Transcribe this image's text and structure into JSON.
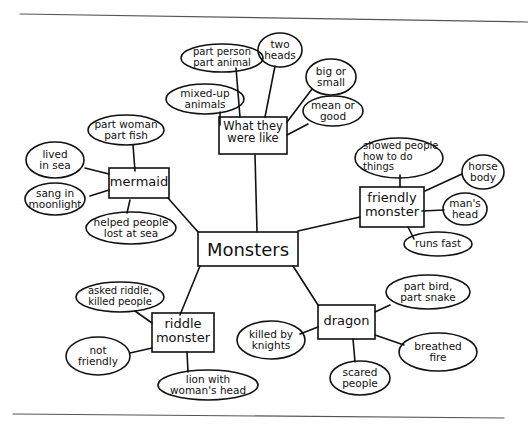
{
  "diagram": {
    "type": "mind-map",
    "center": {
      "label": "Monsters"
    },
    "branches": [
      {
        "label": "What they were like",
        "details": [
          "part person part animal",
          "two heads",
          "mixed-up animals",
          "big or small",
          "mean or good"
        ]
      },
      {
        "label": "mermaid",
        "details": [
          "part woman part fish",
          "lived in sea",
          "sang in moonlight",
          "helped people lost at sea"
        ]
      },
      {
        "label": "friendly monster",
        "details": [
          "showed people how to do things",
          "horse body",
          "man's head",
          "runs fast"
        ]
      },
      {
        "label": "riddle monster",
        "details": [
          "asked riddle, killed people",
          "not friendly",
          "lion with woman's head"
        ]
      },
      {
        "label": "dragon",
        "details": [
          "part bird, part snake",
          "killed by knights",
          "breathed fire",
          "scared people"
        ]
      }
    ]
  },
  "labels": {
    "center": "Monsters",
    "what": "What they\nwere like",
    "what_1": "part person\npart animal",
    "what_2": "two\nheads",
    "what_3": "mixed-up\nanimals",
    "what_4": "big or\nsmall",
    "what_5": "mean or\ngood",
    "mermaid": "mermaid",
    "mermaid_1": "part woman\npart fish",
    "mermaid_2": "lived\nin sea",
    "mermaid_3": "sang in\nmoonlight",
    "mermaid_4": "helped people\nlost at sea",
    "friendly": "friendly\nmonster",
    "friendly_1": "showed people\nhow to do\nthings",
    "friendly_2": "horse\nbody",
    "friendly_3": "man's\nhead",
    "friendly_4": "runs fast",
    "riddle": "riddle\nmonster",
    "riddle_1": "asked riddle,\nkilled people",
    "riddle_2": "not\nfriendly",
    "riddle_3": "lion with\nwoman's head",
    "dragon": "dragon",
    "dragon_1": "part bird,\npart snake",
    "dragon_2": "killed by\nknights",
    "dragon_3": "breathed\nfire",
    "dragon_4": "scared\npeople"
  }
}
